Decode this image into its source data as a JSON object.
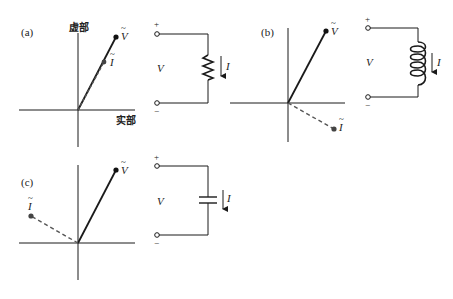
{
  "figure": {
    "panels": [
      {
        "id": "a",
        "label": "(a)",
        "element": "resistor",
        "axis_labels": {
          "imag": "虚部",
          "real": "实部"
        },
        "phasor_V": {
          "label": "V",
          "tilde": "~"
        },
        "phasor_I": {
          "label": "I",
          "tilde": "~",
          "relation": "in phase with V"
        },
        "circuit": {
          "plus": "+",
          "minus": "−",
          "voltage": "V",
          "current": "I"
        }
      },
      {
        "id": "b",
        "label": "(b)",
        "element": "inductor",
        "phasor_V": {
          "label": "V",
          "tilde": "~"
        },
        "phasor_I": {
          "label": "I",
          "tilde": "~",
          "relation": "lags V by 90°"
        },
        "circuit": {
          "plus": "+",
          "minus": "−",
          "voltage": "V",
          "current": "I"
        }
      },
      {
        "id": "c",
        "label": "(c)",
        "element": "capacitor",
        "phasor_V": {
          "label": "V",
          "tilde": "~"
        },
        "phasor_I": {
          "label": "I",
          "tilde": "~",
          "relation": "leads V by 90°"
        },
        "circuit": {
          "plus": "+",
          "minus": "−",
          "voltage": "V",
          "current": "I"
        }
      }
    ],
    "colors": {
      "line": "#1a1a1a",
      "dashed": "#555555",
      "dot": "#111111"
    }
  }
}
